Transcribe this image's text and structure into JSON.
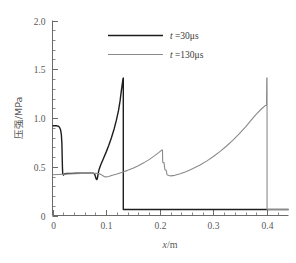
{
  "chart_data": {
    "type": "line",
    "title": "",
    "xlabel": "x/m",
    "ylabel": "压强/MPa",
    "xlim": [
      0,
      0.44
    ],
    "ylim": [
      0,
      2.0
    ],
    "xticks": [
      "0",
      "0.1",
      "0.2",
      "0.3",
      "0.4"
    ],
    "xtick_values": [
      0,
      0.1,
      0.2,
      0.3,
      0.4
    ],
    "yticks": [
      "0",
      "0.5",
      "1.0",
      "1.5",
      "2.0"
    ],
    "ytick_values": [
      0,
      0.5,
      1.0,
      1.5,
      2.0
    ],
    "minor_tick_divisions": 5,
    "grid": false,
    "legend_position": "upper center",
    "series": [
      {
        "name": "t =30μs",
        "time_label": "t",
        "time_value": "=30μs",
        "color": "#1d1d1d",
        "points": [
          [
            0.0,
            0.92
          ],
          [
            0.004,
            0.922
          ],
          [
            0.008,
            0.92
          ],
          [
            0.011,
            0.915
          ],
          [
            0.013,
            0.905
          ],
          [
            0.015,
            0.88
          ],
          [
            0.0165,
            0.83
          ],
          [
            0.0175,
            0.74
          ],
          [
            0.018,
            0.62
          ],
          [
            0.0185,
            0.5
          ],
          [
            0.019,
            0.43
          ],
          [
            0.0205,
            0.415
          ],
          [
            0.023,
            0.428
          ],
          [
            0.028,
            0.432
          ],
          [
            0.035,
            0.432
          ],
          [
            0.045,
            0.433
          ],
          [
            0.055,
            0.433
          ],
          [
            0.065,
            0.434
          ],
          [
            0.072,
            0.434
          ],
          [
            0.0765,
            0.433
          ],
          [
            0.0785,
            0.425
          ],
          [
            0.08,
            0.4
          ],
          [
            0.0815,
            0.375
          ],
          [
            0.0825,
            0.368
          ],
          [
            0.0835,
            0.378
          ],
          [
            0.0845,
            0.405
          ],
          [
            0.0855,
            0.44
          ],
          [
            0.087,
            0.475
          ],
          [
            0.09,
            0.52
          ],
          [
            0.095,
            0.585
          ],
          [
            0.1,
            0.65
          ],
          [
            0.105,
            0.72
          ],
          [
            0.11,
            0.8
          ],
          [
            0.115,
            0.89
          ],
          [
            0.119,
            0.975
          ],
          [
            0.123,
            1.075
          ],
          [
            0.126,
            1.175
          ],
          [
            0.128,
            1.265
          ],
          [
            0.13,
            1.345
          ],
          [
            0.1315,
            1.405
          ],
          [
            0.132,
            1.41
          ],
          [
            0.132,
            0.062
          ],
          [
            0.2,
            0.062
          ],
          [
            0.3,
            0.062
          ],
          [
            0.4,
            0.062
          ],
          [
            0.44,
            0.062
          ]
        ]
      },
      {
        "name": "t =130μs",
        "time_label": "t",
        "time_value": "=130μs",
        "color": "#8a8a8a",
        "points": [
          [
            0.0,
            0.418
          ],
          [
            0.01,
            0.42
          ],
          [
            0.025,
            0.424
          ],
          [
            0.04,
            0.428
          ],
          [
            0.055,
            0.43
          ],
          [
            0.07,
            0.432
          ],
          [
            0.08,
            0.432
          ],
          [
            0.086,
            0.43
          ],
          [
            0.09,
            0.422
          ],
          [
            0.094,
            0.408
          ],
          [
            0.097,
            0.398
          ],
          [
            0.1,
            0.396
          ],
          [
            0.105,
            0.4
          ],
          [
            0.11,
            0.41
          ],
          [
            0.12,
            0.425
          ],
          [
            0.13,
            0.443
          ],
          [
            0.14,
            0.463
          ],
          [
            0.15,
            0.485
          ],
          [
            0.16,
            0.51
          ],
          [
            0.17,
            0.54
          ],
          [
            0.18,
            0.573
          ],
          [
            0.19,
            0.612
          ],
          [
            0.198,
            0.645
          ],
          [
            0.203,
            0.668
          ],
          [
            0.205,
            0.672
          ],
          [
            0.2055,
            0.545
          ],
          [
            0.208,
            0.54
          ],
          [
            0.2095,
            0.47
          ],
          [
            0.212,
            0.465
          ],
          [
            0.2135,
            0.418
          ],
          [
            0.216,
            0.412
          ],
          [
            0.22,
            0.406
          ],
          [
            0.228,
            0.412
          ],
          [
            0.238,
            0.428
          ],
          [
            0.25,
            0.452
          ],
          [
            0.262,
            0.482
          ],
          [
            0.275,
            0.518
          ],
          [
            0.288,
            0.56
          ],
          [
            0.3,
            0.605
          ],
          [
            0.312,
            0.655
          ],
          [
            0.324,
            0.71
          ],
          [
            0.336,
            0.77
          ],
          [
            0.348,
            0.838
          ],
          [
            0.36,
            0.91
          ],
          [
            0.37,
            0.975
          ],
          [
            0.38,
            1.04
          ],
          [
            0.39,
            1.095
          ],
          [
            0.396,
            1.125
          ],
          [
            0.399,
            1.13
          ],
          [
            0.3995,
            1.41
          ],
          [
            0.4,
            1.412
          ],
          [
            0.4,
            0.062
          ],
          [
            0.42,
            0.062
          ],
          [
            0.44,
            0.062
          ]
        ]
      }
    ],
    "annotations": {
      "black_shock_position": 0.132,
      "black_peak_value": 1.41,
      "gray_shock_position": 0.4,
      "gray_peak_value": 1.41,
      "post_shock_value": 0.062
    }
  },
  "legend": {
    "entries": [
      {
        "label_var": "t",
        "label_rest": " =30μs",
        "color": "#1d1d1d"
      },
      {
        "label_var": "t",
        "label_rest": " =130μs",
        "color": "#8a8a8a"
      }
    ]
  }
}
